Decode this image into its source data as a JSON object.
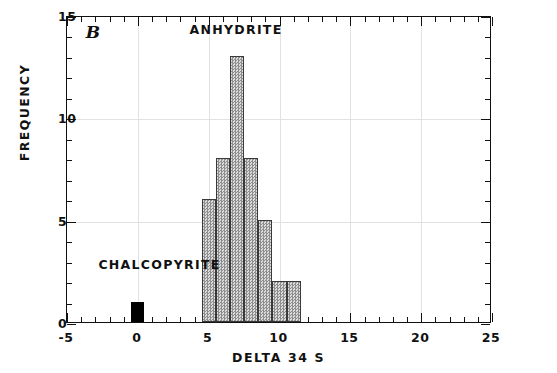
{
  "chart_data": {
    "type": "bar",
    "title": "",
    "panel_label": "B",
    "xlabel": "DELTA 34 S",
    "ylabel": "FREQUENCY",
    "xlim": [
      -5,
      25
    ],
    "ylim": [
      0,
      15
    ],
    "grid": true,
    "legend_position": "none",
    "xticks": [
      -5,
      0,
      5,
      10,
      15,
      20,
      25
    ],
    "xtick_labels": [
      "-5",
      "0",
      "5",
      "10",
      "15",
      "20",
      "25"
    ],
    "x_minor_tick_step": 1,
    "yticks": [
      0,
      5,
      10,
      15
    ],
    "ytick_labels": [
      "0",
      "5",
      "10",
      "15"
    ],
    "y_minor_tick_step": 1,
    "bin_width": 1,
    "series": [
      {
        "name": "ANHYDRITE",
        "fill": "hatched-gray",
        "color": "#b9b9b9",
        "bins": [
          {
            "x_left": 4.5,
            "x_right": 5.5,
            "value": 6
          },
          {
            "x_left": 5.5,
            "x_right": 6.5,
            "value": 8
          },
          {
            "x_left": 6.5,
            "x_right": 7.5,
            "value": 13
          },
          {
            "x_left": 7.5,
            "x_right": 8.5,
            "value": 8
          },
          {
            "x_left": 8.5,
            "x_right": 9.5,
            "value": 5
          },
          {
            "x_left": 9.5,
            "x_right": 10.5,
            "value": 2
          },
          {
            "x_left": 10.5,
            "x_right": 11.5,
            "value": 2
          }
        ]
      },
      {
        "name": "CHALCOPYRITE",
        "fill": "solid-black",
        "color": "#000000",
        "bins": [
          {
            "x_left": -0.45,
            "x_right": 0.45,
            "value": 1
          }
        ]
      }
    ],
    "annotations": [
      {
        "text": "ANHYDRITE",
        "x": 7.0,
        "y": 14.3
      },
      {
        "text": "CHALCOPYRITE",
        "x": 1.6,
        "y": 2.85
      },
      {
        "text": "B",
        "x": -3.6,
        "y": 14.2
      }
    ]
  }
}
